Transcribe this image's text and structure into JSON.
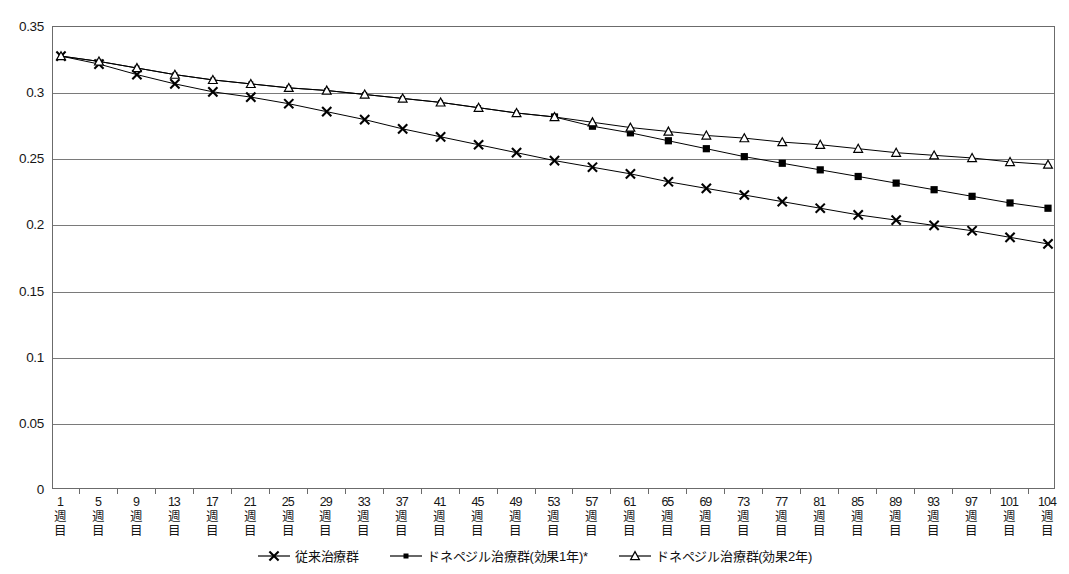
{
  "chart_data": {
    "type": "line",
    "title": "",
    "xlabel": "",
    "ylabel": "",
    "ylim": [
      0,
      0.35
    ],
    "yticks": [
      "0",
      "0.05",
      "0.1",
      "0.15",
      "0.2",
      "0.25",
      "0.3",
      "0.35"
    ],
    "ytick_values": [
      0,
      0.05,
      0.1,
      0.15,
      0.2,
      0.25,
      0.3,
      0.35
    ],
    "grid": true,
    "legend_position": "bottom",
    "categories": [
      "1週目",
      "5週目",
      "9週目",
      "13週目",
      "17週目",
      "21週目",
      "25週目",
      "29週目",
      "33週目",
      "37週目",
      "41週目",
      "45週目",
      "49週目",
      "53週目",
      "57週目",
      "61週目",
      "65週目",
      "69週目",
      "73週目",
      "77週目",
      "81週目",
      "85週目",
      "89週目",
      "93週目",
      "97週目",
      "101週目",
      "104週目"
    ],
    "category_numbers": [
      "1",
      "5",
      "9",
      "13",
      "17",
      "21",
      "25",
      "29",
      "33",
      "37",
      "41",
      "45",
      "49",
      "53",
      "57",
      "61",
      "65",
      "69",
      "73",
      "77",
      "81",
      "85",
      "89",
      "93",
      "97",
      "101",
      "104"
    ],
    "category_suffix": "週目",
    "series": [
      {
        "name": "従来治療群",
        "marker": "x",
        "values": [
          0.328,
          0.322,
          0.314,
          0.307,
          0.301,
          0.297,
          0.292,
          0.286,
          0.28,
          0.273,
          0.267,
          0.261,
          0.255,
          0.249,
          0.244,
          0.239,
          0.233,
          0.228,
          0.223,
          0.218,
          0.213,
          0.208,
          0.204,
          0.2,
          0.196,
          0.191,
          0.186
        ]
      },
      {
        "name": "ドネペジル治療群(効果1年)*",
        "marker": "filled-square",
        "values": [
          0.328,
          0.324,
          0.319,
          0.314,
          0.31,
          0.307,
          0.304,
          0.302,
          0.299,
          0.296,
          0.293,
          0.289,
          0.285,
          0.282,
          0.275,
          0.27,
          0.264,
          0.258,
          0.252,
          0.247,
          0.242,
          0.237,
          0.232,
          0.227,
          0.222,
          0.217,
          0.213
        ]
      },
      {
        "name": "ドネペジル治療群(効果2年)",
        "marker": "open-triangle",
        "values": [
          0.328,
          0.324,
          0.319,
          0.314,
          0.31,
          0.307,
          0.304,
          0.302,
          0.299,
          0.296,
          0.293,
          0.289,
          0.285,
          0.282,
          0.278,
          0.274,
          0.271,
          0.268,
          0.266,
          0.263,
          0.261,
          0.258,
          0.255,
          0.253,
          0.251,
          0.248,
          0.246
        ]
      }
    ]
  },
  "colors": {
    "line": "#000000",
    "grid": "#7a7a7a",
    "frame": "#6b6b6b",
    "text": "#161616"
  }
}
